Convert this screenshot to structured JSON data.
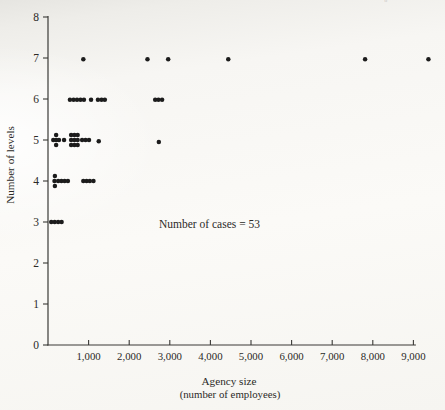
{
  "scan_artifact": "◦",
  "colors": {
    "dot": "#1c1c1c",
    "axis": "#3a3936",
    "text": "#2b2a27"
  },
  "chart_data": {
    "type": "scatter",
    "title": "",
    "xlabel": "Agency size",
    "xlabel_sub": "(number of employees)",
    "ylabel": "Number of levels",
    "annotation": "Number of cases = 53",
    "n_cases": 53,
    "xlim": [
      0,
      9800
    ],
    "ylim": [
      0,
      8
    ],
    "grid": false,
    "legend": "none",
    "x_ticks": [
      {
        "v": 1000,
        "label": "1,000"
      },
      {
        "v": 2000,
        "label": "2,000"
      },
      {
        "v": 3000,
        "label": "3,000"
      },
      {
        "v": 4000,
        "label": "4,000"
      },
      {
        "v": 5000,
        "label": "5,000"
      },
      {
        "v": 6000,
        "label": "6,000"
      },
      {
        "v": 7000,
        "label": "7,000"
      },
      {
        "v": 8000,
        "label": "8,000"
      },
      {
        "v": 9000,
        "label": "9,000"
      }
    ],
    "y_ticks": [
      {
        "v": 0,
        "label": "0"
      },
      {
        "v": 1,
        "label": "1"
      },
      {
        "v": 2,
        "label": "2"
      },
      {
        "v": 3,
        "label": "3"
      },
      {
        "v": 4,
        "label": "4"
      },
      {
        "v": 5,
        "label": "5"
      },
      {
        "v": 6,
        "label": "6"
      },
      {
        "v": 7,
        "label": "7"
      },
      {
        "v": 8,
        "label": "8"
      }
    ],
    "points": [
      {
        "x": 80,
        "y": 3
      },
      {
        "x": 165,
        "y": 3
      },
      {
        "x": 250,
        "y": 3
      },
      {
        "x": 335,
        "y": 3
      },
      {
        "x": 160,
        "y": 4
      },
      {
        "x": 170,
        "y": 4,
        "dy": 0.12
      },
      {
        "x": 170,
        "y": 4,
        "dy": -0.12
      },
      {
        "x": 250,
        "y": 4
      },
      {
        "x": 330,
        "y": 4
      },
      {
        "x": 410,
        "y": 4
      },
      {
        "x": 490,
        "y": 4
      },
      {
        "x": 870,
        "y": 4
      },
      {
        "x": 950,
        "y": 4
      },
      {
        "x": 1030,
        "y": 4
      },
      {
        "x": 1120,
        "y": 4
      },
      {
        "x": 130,
        "y": 5
      },
      {
        "x": 200,
        "y": 5,
        "dy": 0.12
      },
      {
        "x": 200,
        "y": 5
      },
      {
        "x": 200,
        "y": 5,
        "dy": -0.12
      },
      {
        "x": 270,
        "y": 5
      },
      {
        "x": 395,
        "y": 5
      },
      {
        "x": 570,
        "y": 5,
        "dy": 0.12
      },
      {
        "x": 650,
        "y": 5,
        "dy": 0.12
      },
      {
        "x": 730,
        "y": 5,
        "dy": 0.12
      },
      {
        "x": 570,
        "y": 5
      },
      {
        "x": 650,
        "y": 5
      },
      {
        "x": 730,
        "y": 5
      },
      {
        "x": 570,
        "y": 5,
        "dy": -0.12
      },
      {
        "x": 650,
        "y": 5,
        "dy": -0.12
      },
      {
        "x": 730,
        "y": 5,
        "dy": -0.12
      },
      {
        "x": 840,
        "y": 5
      },
      {
        "x": 925,
        "y": 5
      },
      {
        "x": 1010,
        "y": 5
      },
      {
        "x": 1250,
        "y": 5,
        "dy": -0.03
      },
      {
        "x": 2730,
        "y": 5,
        "dy": -0.05
      },
      {
        "x": 540,
        "y": 6,
        "dy": -0.02
      },
      {
        "x": 630,
        "y": 6,
        "dy": -0.02
      },
      {
        "x": 715,
        "y": 6,
        "dy": -0.02
      },
      {
        "x": 800,
        "y": 6,
        "dy": -0.02
      },
      {
        "x": 885,
        "y": 6,
        "dy": -0.02
      },
      {
        "x": 1060,
        "y": 6,
        "dy": -0.02
      },
      {
        "x": 1230,
        "y": 6,
        "dy": -0.02
      },
      {
        "x": 1320,
        "y": 6,
        "dy": -0.02
      },
      {
        "x": 1400,
        "y": 6,
        "dy": -0.02
      },
      {
        "x": 2640,
        "y": 6,
        "dy": -0.02
      },
      {
        "x": 2720,
        "y": 6,
        "dy": -0.02
      },
      {
        "x": 2810,
        "y": 6,
        "dy": -0.02
      },
      {
        "x": 870,
        "y": 7,
        "dy": -0.03
      },
      {
        "x": 2450,
        "y": 7,
        "dy": -0.03
      },
      {
        "x": 2960,
        "y": 7,
        "dy": -0.03
      },
      {
        "x": 4440,
        "y": 7,
        "dy": -0.03
      },
      {
        "x": 7810,
        "y": 7,
        "dy": -0.03
      },
      {
        "x": 9370,
        "y": 7,
        "dy": -0.03
      }
    ]
  }
}
